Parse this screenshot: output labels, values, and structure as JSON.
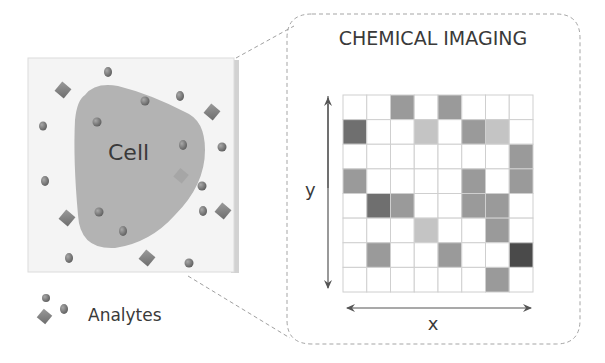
{
  "diagram": {
    "title": "CHEMICAL IMAGING",
    "sample": {
      "cell_label": "Cell",
      "legend_label": "Analytes"
    },
    "axes": {
      "x_label": "x",
      "y_label": "y"
    },
    "grid": {
      "rows": 8,
      "cols": 8,
      "shade_key": {
        "W": "#ffffff",
        "L": "#c4c4c4",
        "M": "#9a9a9a",
        "D": "#6f6f6f",
        "K": "#4a4a4a"
      },
      "cells": [
        [
          "W",
          "W",
          "M",
          "W",
          "M",
          "W",
          "W",
          "W"
        ],
        [
          "D",
          "W",
          "W",
          "L",
          "W",
          "M",
          "L",
          "W"
        ],
        [
          "W",
          "W",
          "W",
          "W",
          "W",
          "W",
          "W",
          "M"
        ],
        [
          "M",
          "W",
          "W",
          "W",
          "W",
          "M",
          "W",
          "M"
        ],
        [
          "W",
          "D",
          "M",
          "W",
          "W",
          "M",
          "M",
          "W"
        ],
        [
          "W",
          "W",
          "W",
          "L",
          "W",
          "W",
          "M",
          "W"
        ],
        [
          "W",
          "M",
          "W",
          "W",
          "M",
          "W",
          "W",
          "K"
        ],
        [
          "W",
          "W",
          "W",
          "W",
          "W",
          "W",
          "M",
          "W"
        ]
      ]
    },
    "colors": {
      "cell_fill": "#b3b3b3",
      "analyte": "#777777",
      "dashed_line": "#9a9a9a",
      "grid_line": "#cfcfcf",
      "axis_arrow": "#555555"
    }
  }
}
